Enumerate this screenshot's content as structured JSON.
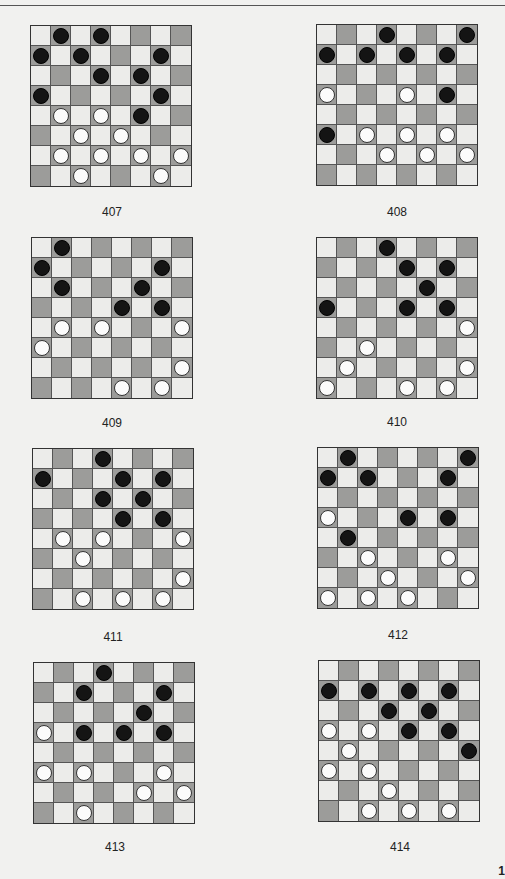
{
  "colors": {
    "dark_square": "#9c9c9a",
    "light_square": "#ececea",
    "black_piece": "#141414",
    "white_piece": "#fbfbfb",
    "background": "#f1f1ef"
  },
  "page_number": "1",
  "boards": [
    {
      "number": "407",
      "x": 30,
      "y": 25,
      "label_x": 72,
      "label_y": 205,
      "black": [
        [
          0,
          1
        ],
        [
          0,
          3
        ],
        [
          1,
          0
        ],
        [
          1,
          2
        ],
        [
          1,
          6
        ],
        [
          2,
          3
        ],
        [
          2,
          5
        ],
        [
          3,
          0
        ],
        [
          3,
          6
        ],
        [
          4,
          5
        ]
      ],
      "white": [
        [
          4,
          1
        ],
        [
          4,
          3
        ],
        [
          5,
          2
        ],
        [
          5,
          4
        ],
        [
          6,
          1
        ],
        [
          6,
          3
        ],
        [
          6,
          5
        ],
        [
          6,
          7
        ],
        [
          7,
          2
        ],
        [
          7,
          6
        ]
      ]
    },
    {
      "number": "408",
      "x": 316,
      "y": 24,
      "label_x": 357,
      "label_y": 205,
      "black": [
        [
          0,
          3
        ],
        [
          0,
          7
        ],
        [
          1,
          0
        ],
        [
          1,
          2
        ],
        [
          1,
          4
        ],
        [
          1,
          6
        ],
        [
          3,
          6
        ],
        [
          5,
          0
        ]
      ],
      "white": [
        [
          3,
          0
        ],
        [
          3,
          4
        ],
        [
          5,
          2
        ],
        [
          5,
          4
        ],
        [
          5,
          6
        ],
        [
          6,
          3
        ],
        [
          6,
          5
        ],
        [
          6,
          7
        ]
      ]
    },
    {
      "number": "409",
      "x": 31,
      "y": 237,
      "label_x": 72,
      "label_y": 416,
      "black": [
        [
          0,
          1
        ],
        [
          1,
          0
        ],
        [
          1,
          6
        ],
        [
          2,
          1
        ],
        [
          2,
          5
        ],
        [
          3,
          4
        ],
        [
          3,
          6
        ]
      ],
      "white": [
        [
          4,
          1
        ],
        [
          4,
          3
        ],
        [
          4,
          7
        ],
        [
          5,
          0
        ],
        [
          6,
          7
        ],
        [
          7,
          4
        ],
        [
          7,
          6
        ]
      ]
    },
    {
      "number": "410",
      "x": 316,
      "y": 237,
      "label_x": 357,
      "label_y": 415,
      "black": [
        [
          0,
          3
        ],
        [
          1,
          4
        ],
        [
          1,
          6
        ],
        [
          2,
          5
        ],
        [
          3,
          0
        ],
        [
          3,
          4
        ],
        [
          3,
          6
        ]
      ],
      "white": [
        [
          4,
          7
        ],
        [
          5,
          2
        ],
        [
          6,
          1
        ],
        [
          6,
          7
        ],
        [
          7,
          0
        ],
        [
          7,
          4
        ],
        [
          7,
          6
        ]
      ]
    },
    {
      "number": "411",
      "x": 32,
      "y": 448,
      "label_x": 73,
      "label_y": 630,
      "black": [
        [
          0,
          3
        ],
        [
          1,
          0
        ],
        [
          1,
          4
        ],
        [
          1,
          6
        ],
        [
          2,
          3
        ],
        [
          2,
          5
        ],
        [
          3,
          4
        ],
        [
          3,
          6
        ]
      ],
      "white": [
        [
          4,
          1
        ],
        [
          4,
          3
        ],
        [
          4,
          7
        ],
        [
          5,
          2
        ],
        [
          6,
          7
        ],
        [
          7,
          2
        ],
        [
          7,
          4
        ],
        [
          7,
          6
        ]
      ]
    },
    {
      "number": "412",
      "x": 317,
      "y": 447,
      "label_x": 358,
      "label_y": 628,
      "black": [
        [
          0,
          1
        ],
        [
          0,
          7
        ],
        [
          1,
          0
        ],
        [
          1,
          2
        ],
        [
          1,
          6
        ],
        [
          3,
          4
        ],
        [
          3,
          6
        ],
        [
          4,
          1
        ]
      ],
      "white": [
        [
          3,
          0
        ],
        [
          5,
          2
        ],
        [
          5,
          6
        ],
        [
          6,
          3
        ],
        [
          6,
          7
        ],
        [
          7,
          0
        ],
        [
          7,
          2
        ],
        [
          7,
          4
        ]
      ]
    },
    {
      "number": "413",
      "x": 33,
      "y": 662,
      "label_x": 75,
      "label_y": 840,
      "black": [
        [
          0,
          3
        ],
        [
          1,
          2
        ],
        [
          1,
          6
        ],
        [
          2,
          5
        ],
        [
          3,
          2
        ],
        [
          3,
          4
        ],
        [
          3,
          6
        ]
      ],
      "white": [
        [
          3,
          0
        ],
        [
          5,
          0
        ],
        [
          5,
          2
        ],
        [
          5,
          6
        ],
        [
          6,
          5
        ],
        [
          6,
          7
        ],
        [
          7,
          2
        ]
      ]
    },
    {
      "number": "414",
      "x": 318,
      "y": 660,
      "label_x": 360,
      "label_y": 840,
      "black": [
        [
          1,
          0
        ],
        [
          1,
          2
        ],
        [
          1,
          4
        ],
        [
          1,
          6
        ],
        [
          2,
          3
        ],
        [
          2,
          5
        ],
        [
          3,
          4
        ],
        [
          3,
          6
        ],
        [
          4,
          7
        ]
      ],
      "white": [
        [
          3,
          0
        ],
        [
          3,
          2
        ],
        [
          4,
          1
        ],
        [
          5,
          0
        ],
        [
          5,
          2
        ],
        [
          6,
          3
        ],
        [
          7,
          2
        ],
        [
          7,
          4
        ],
        [
          7,
          6
        ]
      ]
    }
  ]
}
